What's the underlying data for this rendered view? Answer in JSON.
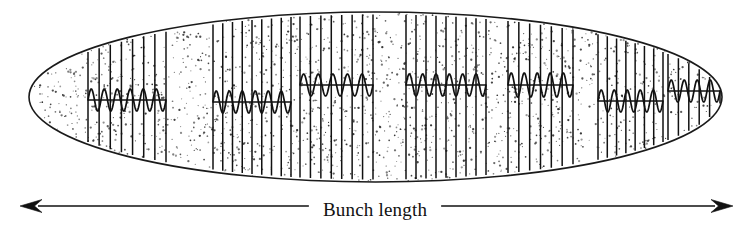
{
  "figure": {
    "title_label": "Bunch length",
    "type": "schematic-diagram",
    "canvas": {
      "width": 753,
      "height": 228,
      "background": "#ffffff"
    },
    "colors": {
      "outline": "#1a1a1a",
      "stipple": "#2b2b2b",
      "fill": "#ffffff",
      "line": "#111111",
      "arrow": "#111111",
      "text": "#111111"
    }
  },
  "envelope": {
    "name": "bunch-envelope-ellipse",
    "shape": "ellipse",
    "cx": 375.5,
    "cy": 97,
    "rx": 346.5,
    "ry": 85,
    "stroke_width": 1.6,
    "fill_pattern": "stipple-dots",
    "stipple_seed": 20250607,
    "stipple_count": 2300
  },
  "micro_bunch_groups": [
    {
      "id": "group-1",
      "x_start": 88,
      "x_end": 166,
      "line_count": 8,
      "wave_y": 100,
      "wave_cycles": 6,
      "wave_amp": 11,
      "baseline_len": 78
    },
    {
      "id": "group-2",
      "x_start": 213,
      "x_end": 291,
      "line_count": 9,
      "wave_y": 102,
      "wave_cycles": 6,
      "wave_amp": 11,
      "baseline_len": 78
    },
    {
      "id": "group-3",
      "x_start": 300,
      "x_end": 373,
      "line_count": 8,
      "wave_y": 85,
      "wave_cycles": 5,
      "wave_amp": 11,
      "baseline_len": 73
    },
    {
      "id": "group-4",
      "x_start": 406,
      "x_end": 486,
      "line_count": 9,
      "wave_y": 85,
      "wave_cycles": 6,
      "wave_amp": 11,
      "baseline_len": 80
    },
    {
      "id": "group-5",
      "x_start": 508,
      "x_end": 573,
      "line_count": 7,
      "wave_y": 85,
      "wave_cycles": 5,
      "wave_amp": 12,
      "baseline_len": 65
    },
    {
      "id": "group-6",
      "x_start": 598,
      "x_end": 663,
      "line_count": 8,
      "wave_y": 101,
      "wave_cycles": 5,
      "wave_amp": 11,
      "baseline_len": 65
    },
    {
      "id": "group-7",
      "x_start": 668,
      "x_end": 720,
      "line_count": 6,
      "wave_y": 91,
      "wave_cycles": 4,
      "wave_amp": 11,
      "baseline_len": 52
    }
  ],
  "dimension": {
    "name": "bunch-length-dimension",
    "label": "Bunch length",
    "label_x": 375,
    "label_y": 212,
    "arrow_y": 206,
    "x_left": 20,
    "x_right": 733,
    "head_length": 22,
    "head_width": 13,
    "stroke_width": 1.6
  }
}
